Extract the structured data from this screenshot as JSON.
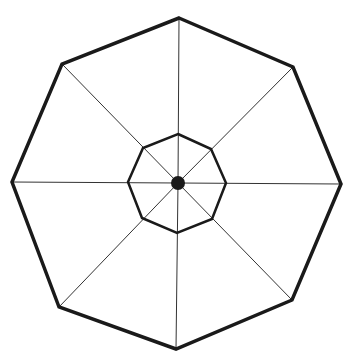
{
  "diagram": {
    "type": "octagonal-umbrella-frame",
    "stroke_color": "#1a1a1a",
    "spoke_color": "#333333",
    "background": "#ffffff",
    "outer_octagon": {
      "points": [
        [
          179,
          18
        ],
        [
          293,
          67
        ],
        [
          341,
          184
        ],
        [
          292,
          300
        ],
        [
          176,
          349
        ],
        [
          59,
          307
        ],
        [
          12,
          182
        ],
        [
          62,
          64
        ]
      ],
      "stroke_width": 3.5
    },
    "inner_octagon": {
      "points": [
        [
          178,
          134
        ],
        [
          211,
          149
        ],
        [
          226,
          183
        ],
        [
          212,
          219
        ],
        [
          177,
          233
        ],
        [
          142,
          218
        ],
        [
          128,
          182
        ],
        [
          143,
          148
        ]
      ],
      "stroke_width": 2.5
    },
    "center": {
      "x": 178,
      "y": 183,
      "r": 7
    },
    "spokes": {
      "stroke_width": 1,
      "count": 8
    }
  }
}
